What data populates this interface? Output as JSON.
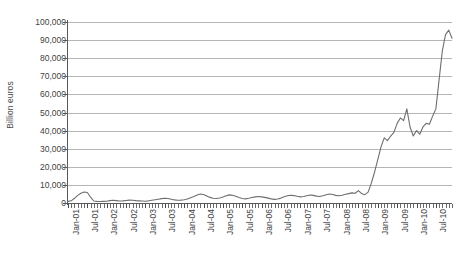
{
  "chart_data": {
    "type": "line",
    "title": "",
    "xlabel": "",
    "ylabel": "Billion euros",
    "ylim": [
      0,
      100000
    ],
    "yticks": [
      0,
      10000,
      20000,
      30000,
      40000,
      50000,
      60000,
      70000,
      80000,
      90000,
      100000
    ],
    "ytick_labels": [
      "0",
      "10,000",
      "20,000",
      "30,000",
      "40,000",
      "50,000",
      "60,000",
      "70,000",
      "80,000",
      "90,000",
      "100,000"
    ],
    "grid": true,
    "legend": "none",
    "series_color": "#6e6e6e",
    "gridline_color": "#b5b5b5",
    "axis_color": "#585858",
    "x_tick_labels": [
      "Jan-01",
      "Jul-01",
      "Jan-02",
      "Jul-02",
      "Jan-03",
      "Jul-03",
      "Jan-04",
      "Jul-04",
      "Jan-05",
      "Jul-05",
      "Jan-06",
      "Jul-06",
      "Jan-07",
      "Jul-07",
      "Jan-08",
      "Jul-08",
      "Jan-09",
      "Jul-09",
      "Jan-10",
      "Jul-10"
    ],
    "x_tick_interval_months": 6,
    "x_start": "Jan-01",
    "x_end": "Dec-10",
    "series": [
      {
        "name": "Billion euros",
        "x": [
          "Jan-01",
          "Feb-01",
          "Mar-01",
          "Apr-01",
          "May-01",
          "Jun-01",
          "Jul-01",
          "Aug-01",
          "Sep-01",
          "Oct-01",
          "Nov-01",
          "Dec-01",
          "Jan-02",
          "Feb-02",
          "Mar-02",
          "Apr-02",
          "May-02",
          "Jun-02",
          "Jul-02",
          "Aug-02",
          "Sep-02",
          "Oct-02",
          "Nov-02",
          "Dec-02",
          "Jan-03",
          "Feb-03",
          "Mar-03",
          "Apr-03",
          "May-03",
          "Jun-03",
          "Jul-03",
          "Aug-03",
          "Sep-03",
          "Oct-03",
          "Nov-03",
          "Dec-03",
          "Jan-04",
          "Feb-04",
          "Mar-04",
          "Apr-04",
          "May-04",
          "Jun-04",
          "Jul-04",
          "Aug-04",
          "Sep-04",
          "Oct-04",
          "Nov-04",
          "Dec-04",
          "Jan-05",
          "Feb-05",
          "Mar-05",
          "Apr-05",
          "May-05",
          "Jun-05",
          "Jul-05",
          "Aug-05",
          "Sep-05",
          "Oct-05",
          "Nov-05",
          "Dec-05",
          "Jan-06",
          "Feb-06",
          "Mar-06",
          "Apr-06",
          "May-06",
          "Jun-06",
          "Jul-06",
          "Aug-06",
          "Sep-06",
          "Oct-06",
          "Nov-06",
          "Dec-06",
          "Jan-07",
          "Feb-07",
          "Mar-07",
          "Apr-07",
          "May-07",
          "Jun-07",
          "Jul-07",
          "Aug-07",
          "Sep-07",
          "Oct-07",
          "Nov-07",
          "Dec-07",
          "Jan-08",
          "Feb-08",
          "Mar-08",
          "Apr-08",
          "May-08",
          "Jun-08",
          "Jul-08",
          "Aug-08",
          "Sep-08",
          "Oct-08",
          "Nov-08",
          "Dec-08",
          "Jan-09",
          "Feb-09",
          "Mar-09",
          "Apr-09",
          "May-09",
          "Jun-09",
          "Jul-09",
          "Aug-09",
          "Sep-09",
          "Oct-09",
          "Nov-09",
          "Dec-09",
          "Jan-10",
          "Feb-10",
          "Mar-10",
          "Apr-10",
          "May-10",
          "Jun-10",
          "Jul-10",
          "Aug-10",
          "Sep-10",
          "Oct-10",
          "Nov-10",
          "Dec-10"
        ],
        "values": [
          900,
          1200,
          2600,
          4200,
          5400,
          6100,
          5800,
          3200,
          1100,
          900,
          800,
          900,
          1000,
          1300,
          1500,
          1300,
          1100,
          1200,
          1400,
          1600,
          1500,
          1300,
          1200,
          1100,
          1000,
          1200,
          1500,
          1800,
          2100,
          2400,
          2600,
          2500,
          2100,
          1700,
          1500,
          1600,
          1800,
          2200,
          2900,
          3600,
          4400,
          5000,
          4700,
          3900,
          3100,
          2600,
          2500,
          2800,
          3300,
          4000,
          4500,
          4300,
          3700,
          3000,
          2500,
          2300,
          2600,
          3000,
          3400,
          3600,
          3400,
          3100,
          2700,
          2300,
          2000,
          2200,
          2700,
          3400,
          4000,
          4300,
          4100,
          3700,
          3400,
          3600,
          4000,
          4400,
          4200,
          3800,
          3600,
          4000,
          4600,
          5000,
          4700,
          4200,
          4000,
          4300,
          4800,
          5200,
          5600,
          5400,
          6800,
          5200,
          4600,
          6000,
          11000,
          17000,
          24000,
          31000,
          36000,
          34500,
          37000,
          39000,
          44000,
          47000,
          45500,
          52000,
          42000,
          37000,
          40000,
          38000,
          42000,
          44000,
          43500,
          48000,
          52000,
          68000,
          84000,
          93000,
          95500,
          91000
        ]
      }
    ]
  }
}
